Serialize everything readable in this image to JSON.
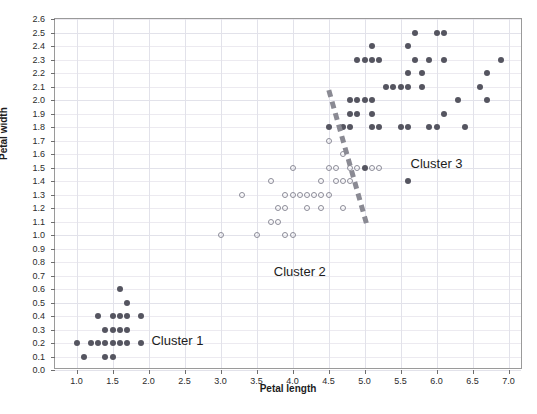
{
  "chart_data": {
    "type": "scatter",
    "title": "",
    "xlabel": "Petal length",
    "ylabel": "Petal width",
    "xlim": [
      0.7,
      7.2
    ],
    "ylim": [
      0.0,
      2.6
    ],
    "xticks": [
      "1.0",
      "1.5",
      "2.0",
      "2.5",
      "3.0",
      "3.5",
      "4.0",
      "4.5",
      "5.0",
      "5.5",
      "6.0",
      "6.5",
      "7.0"
    ],
    "xtick_values": [
      1.0,
      1.5,
      2.0,
      2.5,
      3.0,
      3.5,
      4.0,
      4.5,
      5.0,
      5.5,
      6.0,
      6.5,
      7.0
    ],
    "yticks": [
      "0.0",
      "0.1",
      "0.2",
      "0.3",
      "0.4",
      "0.5",
      "0.6",
      "0.7",
      "0.8",
      "0.9",
      "1.0",
      "1.1",
      "1.2",
      "1.3",
      "1.4",
      "1.5",
      "1.6",
      "1.7",
      "1.8",
      "1.9",
      "2.0",
      "2.1",
      "2.2",
      "2.3",
      "2.4",
      "2.5",
      "2.6"
    ],
    "ytick_values": [
      0.0,
      0.1,
      0.2,
      0.3,
      0.4,
      0.5,
      0.6,
      0.7,
      0.8,
      0.9,
      1.0,
      1.1,
      1.2,
      1.3,
      1.4,
      1.5,
      1.6,
      1.7,
      1.8,
      1.9,
      2.0,
      2.1,
      2.2,
      2.3,
      2.4,
      2.5,
      2.6
    ],
    "grid": true,
    "legend": "none",
    "marker_colors": {
      "filled": "#555560",
      "open": "#8c8c98"
    },
    "series": [
      {
        "name": "Cluster 1",
        "marker": "filled",
        "points": [
          [
            1.6,
            0.6
          ],
          [
            1.7,
            0.5
          ],
          [
            1.3,
            0.4
          ],
          [
            1.5,
            0.4
          ],
          [
            1.6,
            0.4
          ],
          [
            1.7,
            0.4
          ],
          [
            1.9,
            0.4
          ],
          [
            1.4,
            0.3
          ],
          [
            1.5,
            0.3
          ],
          [
            1.6,
            0.3
          ],
          [
            1.7,
            0.3
          ],
          [
            1.0,
            0.2
          ],
          [
            1.2,
            0.2
          ],
          [
            1.3,
            0.2
          ],
          [
            1.4,
            0.2
          ],
          [
            1.5,
            0.2
          ],
          [
            1.6,
            0.2
          ],
          [
            1.7,
            0.2
          ],
          [
            1.9,
            0.2
          ],
          [
            1.1,
            0.1
          ],
          [
            1.4,
            0.1
          ],
          [
            1.5,
            0.1
          ]
        ]
      },
      {
        "name": "Cluster 2",
        "marker": "open",
        "points": [
          [
            4.5,
            1.7
          ],
          [
            4.7,
            1.6
          ],
          [
            4.0,
            1.5
          ],
          [
            4.5,
            1.5
          ],
          [
            4.6,
            1.5
          ],
          [
            4.8,
            1.5
          ],
          [
            4.9,
            1.5
          ],
          [
            5.1,
            1.5
          ],
          [
            5.2,
            1.5
          ],
          [
            3.7,
            1.4
          ],
          [
            4.4,
            1.4
          ],
          [
            4.6,
            1.4
          ],
          [
            4.7,
            1.4
          ],
          [
            4.8,
            1.4
          ],
          [
            3.3,
            1.3
          ],
          [
            3.9,
            1.3
          ],
          [
            4.0,
            1.3
          ],
          [
            4.1,
            1.3
          ],
          [
            4.2,
            1.3
          ],
          [
            4.3,
            1.3
          ],
          [
            4.4,
            1.3
          ],
          [
            4.5,
            1.3
          ],
          [
            3.8,
            1.2
          ],
          [
            3.9,
            1.2
          ],
          [
            4.2,
            1.2
          ],
          [
            4.4,
            1.2
          ],
          [
            4.7,
            1.2
          ],
          [
            3.7,
            1.1
          ],
          [
            3.8,
            1.1
          ],
          [
            3.0,
            1.0
          ],
          [
            3.5,
            1.0
          ],
          [
            3.9,
            1.0
          ],
          [
            4.0,
            1.0
          ]
        ]
      },
      {
        "name": "Cluster 3",
        "marker": "filled",
        "points": [
          [
            5.7,
            2.5
          ],
          [
            6.0,
            2.5
          ],
          [
            6.1,
            2.5
          ],
          [
            5.1,
            2.4
          ],
          [
            5.6,
            2.4
          ],
          [
            4.9,
            2.3
          ],
          [
            5.0,
            2.3
          ],
          [
            5.1,
            2.3
          ],
          [
            5.2,
            2.3
          ],
          [
            5.7,
            2.3
          ],
          [
            5.9,
            2.3
          ],
          [
            6.1,
            2.3
          ],
          [
            6.9,
            2.3
          ],
          [
            5.6,
            2.2
          ],
          [
            5.8,
            2.2
          ],
          [
            6.7,
            2.2
          ],
          [
            5.3,
            2.1
          ],
          [
            5.4,
            2.1
          ],
          [
            5.5,
            2.1
          ],
          [
            5.6,
            2.1
          ],
          [
            5.8,
            2.1
          ],
          [
            6.6,
            2.1
          ],
          [
            4.8,
            2.0
          ],
          [
            4.9,
            2.0
          ],
          [
            5.0,
            2.0
          ],
          [
            5.1,
            2.0
          ],
          [
            6.3,
            2.0
          ],
          [
            6.7,
            2.0
          ],
          [
            4.8,
            1.9
          ],
          [
            4.9,
            1.9
          ],
          [
            5.1,
            1.9
          ],
          [
            6.1,
            1.9
          ],
          [
            4.5,
            1.8
          ],
          [
            4.7,
            1.8
          ],
          [
            4.8,
            1.8
          ],
          [
            5.1,
            1.8
          ],
          [
            5.2,
            1.8
          ],
          [
            5.5,
            1.8
          ],
          [
            5.6,
            1.8
          ],
          [
            5.9,
            1.8
          ],
          [
            6.0,
            1.8
          ],
          [
            6.4,
            1.8
          ],
          [
            5.0,
            1.5
          ],
          [
            5.6,
            1.4
          ]
        ]
      }
    ],
    "annotations": [
      {
        "text": "Cluster 1",
        "x": 2.4,
        "y": 0.22
      },
      {
        "text": "Cluster 2",
        "x": 4.1,
        "y": 0.73
      },
      {
        "text": "Cluster 3",
        "x": 6.0,
        "y": 1.53
      }
    ],
    "separator_line": {
      "style": "dashed",
      "color": "#8a8a93",
      "from": [
        4.52,
        2.07
      ],
      "to": [
        5.06,
        1.05
      ]
    }
  }
}
